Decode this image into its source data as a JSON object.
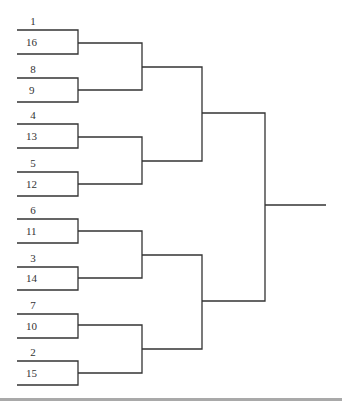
{
  "bracket": {
    "line_color": "#333333",
    "matchups": [
      {
        "top_seed": "1",
        "bottom_seed": "16"
      },
      {
        "top_seed": "8",
        "bottom_seed": "9"
      },
      {
        "top_seed": "4",
        "bottom_seed": "13"
      },
      {
        "top_seed": "5",
        "bottom_seed": "12"
      },
      {
        "top_seed": "6",
        "bottom_seed": "11"
      },
      {
        "top_seed": "3",
        "bottom_seed": "14"
      },
      {
        "top_seed": "7",
        "bottom_seed": "10"
      },
      {
        "top_seed": "2",
        "bottom_seed": "15"
      }
    ]
  },
  "footer": {
    "bar_color": "#a9a9a9"
  }
}
